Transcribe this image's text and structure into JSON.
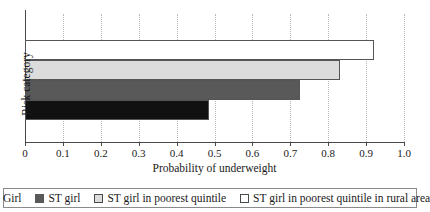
{
  "chart_data": {
    "type": "bar",
    "orientation": "horizontal",
    "title": "",
    "xlabel": "Probability of underweight",
    "ylabel": "Risk category",
    "xlim": [
      0,
      1.0
    ],
    "grid": "vertical-dotted",
    "legend_position": "bottom",
    "categories": [
      "Girl",
      "ST girl",
      "ST girl in poorest quintile",
      "ST girl in poorest quintile in rural area"
    ],
    "values": [
      0.485,
      0.725,
      0.83,
      0.92
    ],
    "colors": [
      "#111111",
      "#595959",
      "#dcdcdc",
      "#ffffff"
    ],
    "xticks": [
      {
        "value": 0,
        "label": "0"
      },
      {
        "value": 0.1,
        "label": "0.1"
      },
      {
        "value": 0.2,
        "label": "0.2"
      },
      {
        "value": 0.3,
        "label": "0.3"
      },
      {
        "value": 0.4,
        "label": "0.4"
      },
      {
        "value": 0.5,
        "label": "0.5"
      },
      {
        "value": 0.6,
        "label": "0.6"
      },
      {
        "value": 0.7,
        "label": "0.7"
      },
      {
        "value": 0.8,
        "label": "0.8"
      },
      {
        "value": 0.9,
        "label": "0.9"
      },
      {
        "value": 1.0,
        "label": "1.0"
      }
    ],
    "bars": [
      {
        "label": "ST girl in poorest quintile in rural area",
        "value": 0.92,
        "color": "#ffffff",
        "outlined": true
      },
      {
        "label": "ST girl in poorest quintile",
        "value": 0.83,
        "color": "#dcdcdc",
        "outlined": true
      },
      {
        "label": "ST girl",
        "value": 0.725,
        "color": "#595959",
        "outlined": true
      },
      {
        "label": "Girl",
        "value": 0.485,
        "color": "#111111",
        "outlined": true
      }
    ],
    "legend": [
      {
        "label": "Girl",
        "color": "#111111",
        "outlined": false
      },
      {
        "label": "ST girl",
        "color": "#595959",
        "outlined": false
      },
      {
        "label": "ST girl in poorest quintile",
        "color": "#dcdcdc",
        "outlined": true
      },
      {
        "label": "ST girl in poorest quintile in rural area",
        "color": "#ffffff",
        "outlined": true
      }
    ]
  }
}
